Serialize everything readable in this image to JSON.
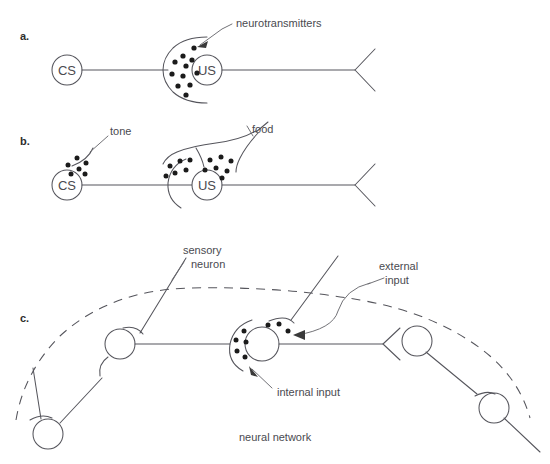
{
  "figure": {
    "background_color": "#ffffff",
    "stroke_color": "#55555c",
    "vesicle_color": "#1b1b1b",
    "text_color": "#4a4a50"
  },
  "panels": [
    {
      "id": "a",
      "letter": "a.",
      "neurons": [
        {
          "label": "CS",
          "role": "conditioned-stimulus-neuron"
        },
        {
          "label": "US",
          "role": "unconditioned-stimulus-neuron"
        }
      ],
      "annotations": [
        {
          "text": "neurotransmitters",
          "target": "presynaptic-vesicles",
          "has_arrow": true
        }
      ],
      "vesicle_count": 11
    },
    {
      "id": "b",
      "letter": "b.",
      "neurons": [
        {
          "label": "CS",
          "role": "conditioned-stimulus-neuron"
        },
        {
          "label": "US",
          "role": "unconditioned-stimulus-neuron"
        }
      ],
      "annotations": [
        {
          "text": "tone",
          "target": "cs-input-terminal",
          "has_arrow": false
        },
        {
          "text": "food",
          "target": "us-input-terminals",
          "has_arrow": false
        }
      ],
      "vesicle_count": 21
    },
    {
      "id": "c",
      "letter": "c.",
      "caption": "neural network",
      "neurons": [
        {
          "label": "",
          "role": "sensory-neuron"
        },
        {
          "label": "",
          "role": "interneuron"
        },
        {
          "label": "",
          "role": "output-neuron"
        },
        {
          "label": "",
          "role": "lower-left-neuron"
        },
        {
          "label": "",
          "role": "lower-right-neuron"
        }
      ],
      "annotations": [
        {
          "text": "sensory\nneuron",
          "line1": "sensory",
          "line2": "neuron",
          "target": "sensory-neuron",
          "has_arrow": false
        },
        {
          "text": "external\ninput",
          "line1": "external",
          "line2": "input",
          "target": "interneuron-external-terminal",
          "has_arrow": true
        },
        {
          "text": "internal input",
          "line1": "internal input",
          "line2": "",
          "target": "interneuron-internal-terminal",
          "has_arrow": true
        }
      ],
      "boundary": {
        "style": "dashed",
        "meaning": "network boundary"
      }
    }
  ]
}
